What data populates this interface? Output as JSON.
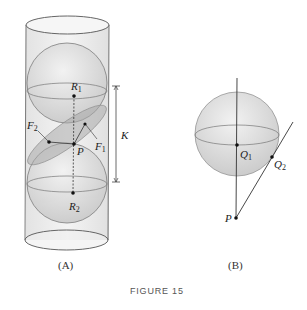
{
  "figure": {
    "caption": "FIGURE 15",
    "panels": [
      {
        "id": "A",
        "label": "(A)",
        "points": [
          {
            "name": "R",
            "sub": "1"
          },
          {
            "name": "R",
            "sub": "2"
          },
          {
            "name": "F",
            "sub": "1"
          },
          {
            "name": "F",
            "sub": "2"
          },
          {
            "name": "P",
            "sub": ""
          }
        ],
        "dimension_label": "K"
      },
      {
        "id": "B",
        "label": "(B)",
        "points": [
          {
            "name": "Q",
            "sub": "1"
          },
          {
            "name": "Q",
            "sub": "2"
          },
          {
            "name": "P",
            "sub": ""
          }
        ]
      }
    ]
  },
  "colors": {
    "cylinder_fill": "#ececec",
    "sphere_fill": "#d8d8d8",
    "plane_fill": "#b4b4b4",
    "stroke": "#555555",
    "dot": "#111111"
  }
}
